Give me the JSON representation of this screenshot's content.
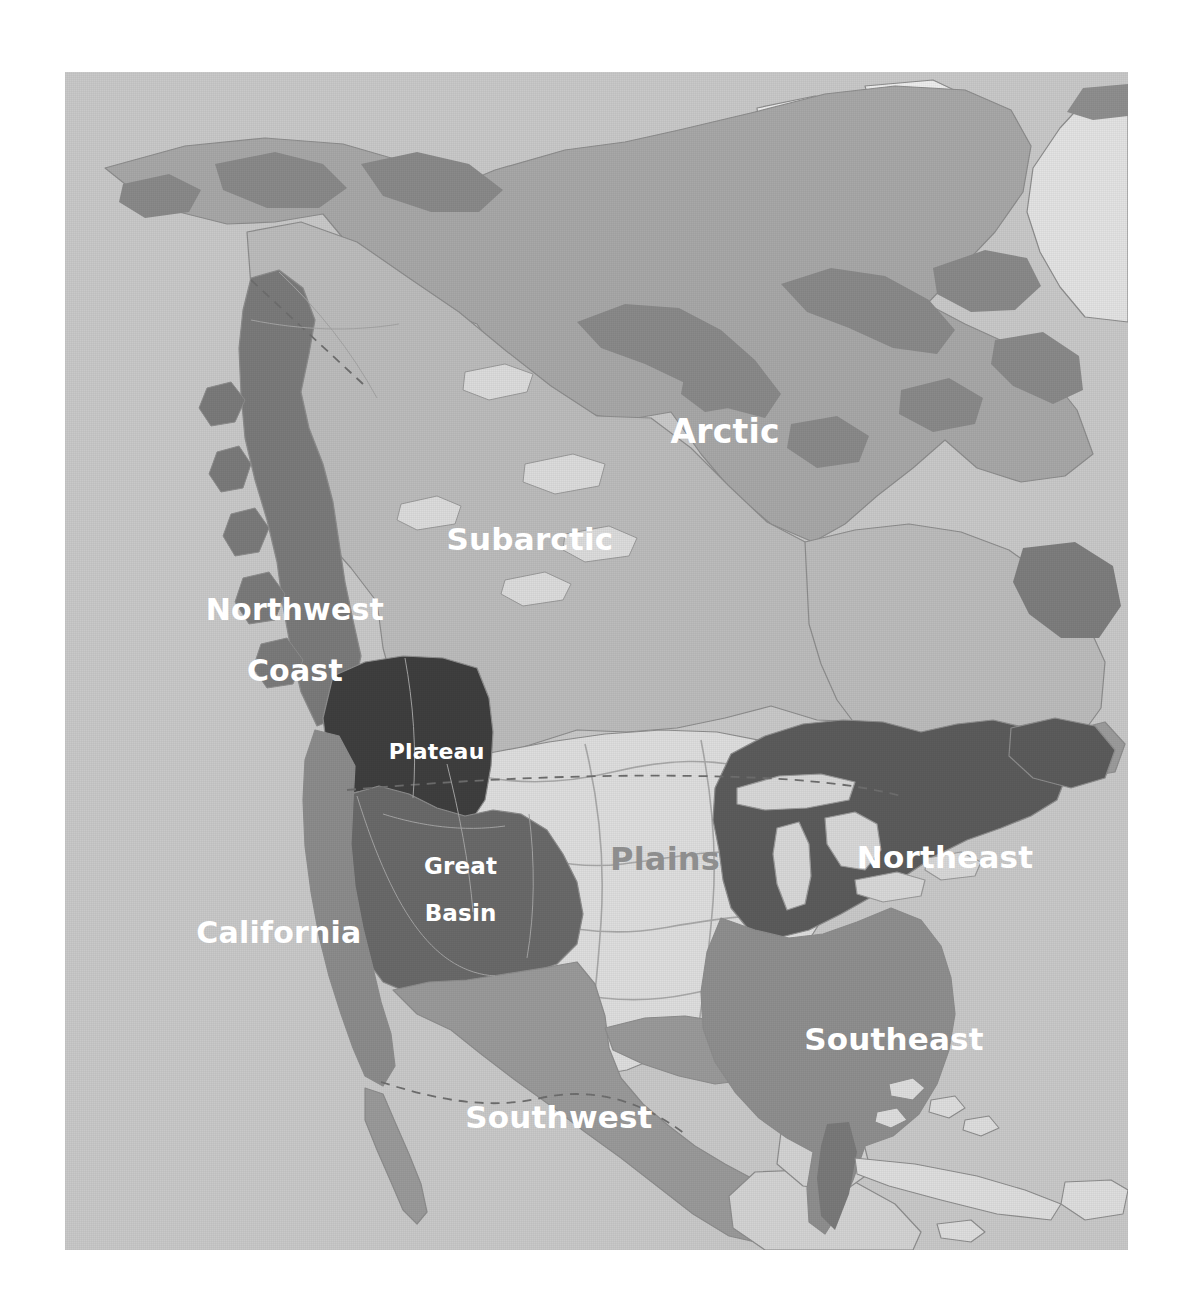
{
  "figure": {
    "kind": "reference-map",
    "frame": {
      "x": 65,
      "y": 72,
      "width": 1063,
      "height": 1178
    },
    "page_background": "#ffffff",
    "ocean_color": "#c9c9c9",
    "outline_color": "#8d8d8d",
    "border_dash_color": "#6e6e6e"
  },
  "palette": {
    "ocean": "#c9c9c9",
    "unlabeled_land": "#d6d6d6",
    "arctic": "#a8a8a8",
    "subarctic": "#bcbcbc",
    "northwest_coast": "#7b7b7b",
    "plateau": "#3f3f3f",
    "great_basin": "#6a6a6a",
    "california": "#8c8c8c",
    "southwest": "#9a9a9a",
    "plains": "#dedede",
    "northeast": "#5c5c5c",
    "southeast": "#8f8f8f",
    "greenland_ice": "#e8e8e8",
    "label_white": "#ffffff",
    "label_gray": "#8e8e8e"
  },
  "regions": [
    {
      "id": "arctic",
      "name": "Arctic",
      "fill": "#a8a8a8",
      "label_color": "#ffffff"
    },
    {
      "id": "subarctic",
      "name": "Subarctic",
      "fill": "#bcbcbc",
      "label_color": "#ffffff"
    },
    {
      "id": "northwest-coast",
      "name": "Northwest Coast",
      "fill": "#7b7b7b",
      "label_color": "#ffffff"
    },
    {
      "id": "plateau",
      "name": "Plateau",
      "fill": "#3f3f3f",
      "label_color": "#ffffff"
    },
    {
      "id": "great-basin",
      "name": "Great Basin",
      "fill": "#6a6a6a",
      "label_color": "#ffffff"
    },
    {
      "id": "california",
      "name": "California",
      "fill": "#8c8c8c",
      "label_color": "#ffffff"
    },
    {
      "id": "southwest",
      "name": "Southwest",
      "fill": "#9a9a9a",
      "label_color": "#ffffff"
    },
    {
      "id": "plains",
      "name": "Plains",
      "fill": "#dedede",
      "label_color": "#8e8e8e"
    },
    {
      "id": "northeast",
      "name": "Northeast",
      "fill": "#5c5c5c",
      "label_color": "#ffffff"
    },
    {
      "id": "southeast",
      "name": "Southeast",
      "fill": "#8f8f8f",
      "label_color": "#ffffff"
    }
  ],
  "labels": [
    {
      "id": "arctic",
      "text": "Arctic",
      "line2": "",
      "x": 625,
      "y": 360,
      "size": 33,
      "color": "white",
      "align": "center"
    },
    {
      "id": "subarctic",
      "text": "Subarctic",
      "line2": "",
      "x": 432,
      "y": 468,
      "size": 31,
      "color": "white",
      "align": "center"
    },
    {
      "id": "northwest-coast",
      "text": "Northwest",
      "line2": "Coast",
      "x": 198,
      "y": 569,
      "size": 30,
      "color": "white",
      "align": "center"
    },
    {
      "id": "plateau",
      "text": "Plateau",
      "line2": "",
      "x": 348,
      "y": 680,
      "size": 22,
      "color": "white",
      "align": "center"
    },
    {
      "id": "great-basin",
      "text": "Great",
      "line2": "Basin",
      "x": 371,
      "y": 818,
      "size": 23,
      "color": "white",
      "align": "center"
    },
    {
      "id": "california",
      "text": "California",
      "line2": "",
      "x": 182,
      "y": 861,
      "size": 30,
      "color": "white",
      "align": "center"
    },
    {
      "id": "plains",
      "text": "Plains",
      "line2": "",
      "x": 566,
      "y": 787,
      "size": 32,
      "color": "gray",
      "align": "center"
    },
    {
      "id": "northeast",
      "text": "Northeast",
      "line2": "",
      "x": 847,
      "y": 786,
      "size": 31,
      "color": "white",
      "align": "center"
    },
    {
      "id": "southeast",
      "text": "Southeast",
      "line2": "",
      "x": 796,
      "y": 968,
      "size": 31,
      "color": "white",
      "align": "center"
    },
    {
      "id": "southwest",
      "text": "Southwest",
      "line2": "",
      "x": 461,
      "y": 1046,
      "size": 31,
      "color": "white",
      "align": "center"
    }
  ]
}
